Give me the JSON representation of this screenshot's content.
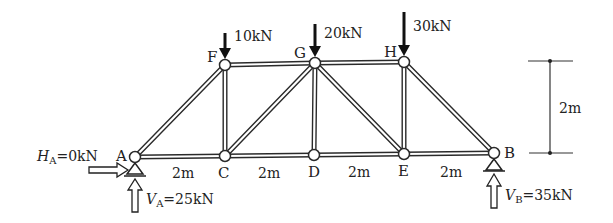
{
  "diagram": {
    "type": "pratt-truss",
    "nodes": {
      "A": {
        "label": "A",
        "x": 135,
        "y": 157
      },
      "C": {
        "label": "C",
        "x": 225,
        "y": 156
      },
      "D": {
        "label": "D",
        "x": 314,
        "y": 155
      },
      "E": {
        "label": "E",
        "x": 404,
        "y": 154
      },
      "B": {
        "label": "B",
        "x": 494,
        "y": 153
      },
      "F": {
        "label": "F",
        "x": 225,
        "y": 65
      },
      "G": {
        "label": "G",
        "x": 315,
        "y": 63
      },
      "H": {
        "label": "H",
        "x": 404,
        "y": 62
      }
    },
    "members": [
      [
        "A",
        "C"
      ],
      [
        "C",
        "D"
      ],
      [
        "D",
        "E"
      ],
      [
        "E",
        "B"
      ],
      [
        "F",
        "G"
      ],
      [
        "G",
        "H"
      ],
      [
        "A",
        "F"
      ],
      [
        "F",
        "C"
      ],
      [
        "C",
        "G"
      ],
      [
        "G",
        "D"
      ],
      [
        "G",
        "E"
      ],
      [
        "H",
        "E"
      ],
      [
        "H",
        "B"
      ]
    ],
    "loads": [
      {
        "node": "F",
        "label": "10kN"
      },
      {
        "node": "G",
        "label": "20kN"
      },
      {
        "node": "H",
        "label": "30kN"
      }
    ],
    "reactions": {
      "HA": {
        "symbol": "H",
        "subscript": "A",
        "value": "=0kN"
      },
      "VA": {
        "symbol": "V",
        "subscript": "A",
        "value": "=25kN"
      },
      "VB": {
        "symbol": "V",
        "subscript": "B",
        "value": "=35kN"
      }
    },
    "spans": [
      "2m",
      "2m",
      "2m",
      "2m"
    ],
    "height_dimension": "2m"
  }
}
